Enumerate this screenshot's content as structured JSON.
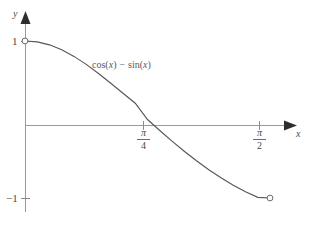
{
  "chart_data": {
    "type": "line",
    "title": "",
    "subtitle": "",
    "xlabel": "x",
    "ylabel": "y",
    "grid": false,
    "legend": "none",
    "annotations": [
      {
        "name": "curve-function-label",
        "text": "cos(x) − sin(x)",
        "parts": {
          "fn1": "cos(",
          "var1": "x",
          "close1": ")",
          "operator": "−",
          "fn2": "sin(",
          "var2": "x",
          "close2": ")"
        }
      }
    ],
    "xlim": [
      0,
      1.5708
    ],
    "ylim": [
      -1,
      1
    ],
    "x_ticks": [
      {
        "value": 0.7854,
        "label_num": "π",
        "label_den": "4",
        "label": "π/4"
      },
      {
        "value": 1.5708,
        "label_num": "π",
        "label_den": "2",
        "label": "π/2"
      }
    ],
    "y_ticks": [
      {
        "value": 1,
        "label": "1"
      },
      {
        "value": -1,
        "label": "−1"
      }
    ],
    "endpoints": [
      {
        "name": "left-open-endpoint",
        "x": 0,
        "y": 1,
        "style": "open-circle"
      },
      {
        "name": "right-open-endpoint",
        "x": 1.5708,
        "y": -1,
        "style": "open-circle"
      }
    ],
    "x": [
      0,
      0.0785,
      0.1571,
      0.2356,
      0.3142,
      0.3927,
      0.4712,
      0.5498,
      0.6283,
      0.7069,
      0.7854,
      0.8639,
      0.9425,
      1.021,
      1.0996,
      1.1781,
      1.2566,
      1.3352,
      1.4137,
      1.4923,
      1.5708
    ],
    "values": [
      1.0,
      0.9891,
      0.9511,
      0.8883,
      0.8041,
      0.7022,
      0.5868,
      0.4627,
      0.3346,
      0.2079,
      0.0,
      -0.1405,
      -0.2756,
      -0.4043,
      -0.5257,
      -0.6391,
      -0.7431,
      -0.8371,
      -0.9204,
      -0.9912,
      -1.0
    ],
    "series": [
      {
        "name": "cos(x) - sin(x)",
        "values": [
          1.0,
          0.9891,
          0.9511,
          0.8883,
          0.8041,
          0.7022,
          0.5868,
          0.4627,
          0.3346,
          0.2079,
          0.0,
          -0.1405,
          -0.2756,
          -0.4043,
          -0.5257,
          -0.6391,
          -0.7431,
          -0.8371,
          -0.9204,
          -0.9912,
          -1.0
        ]
      }
    ]
  },
  "colors": {
    "background": "#ffffff",
    "axis": "#9a9a9a",
    "axis_arrow": "#2e2e2e",
    "curve": "#575757",
    "text": "#4a4a4a",
    "tick": "#6a6a6a",
    "endpoint_stroke": "#6a6a6a"
  },
  "labels": {
    "y_axis_name": "y",
    "x_axis_name": "x",
    "y_tick_one": "1",
    "y_tick_minus_one": "−1",
    "pi_numerator": "π",
    "four_denominator": "4",
    "two_denominator": "2",
    "fn_cos_open": "cos(",
    "fn_var_x1": "x",
    "fn_close1": ")",
    "fn_minus": "−",
    "fn_sin_open": "sin(",
    "fn_var_x2": "x",
    "fn_close2": ")"
  }
}
